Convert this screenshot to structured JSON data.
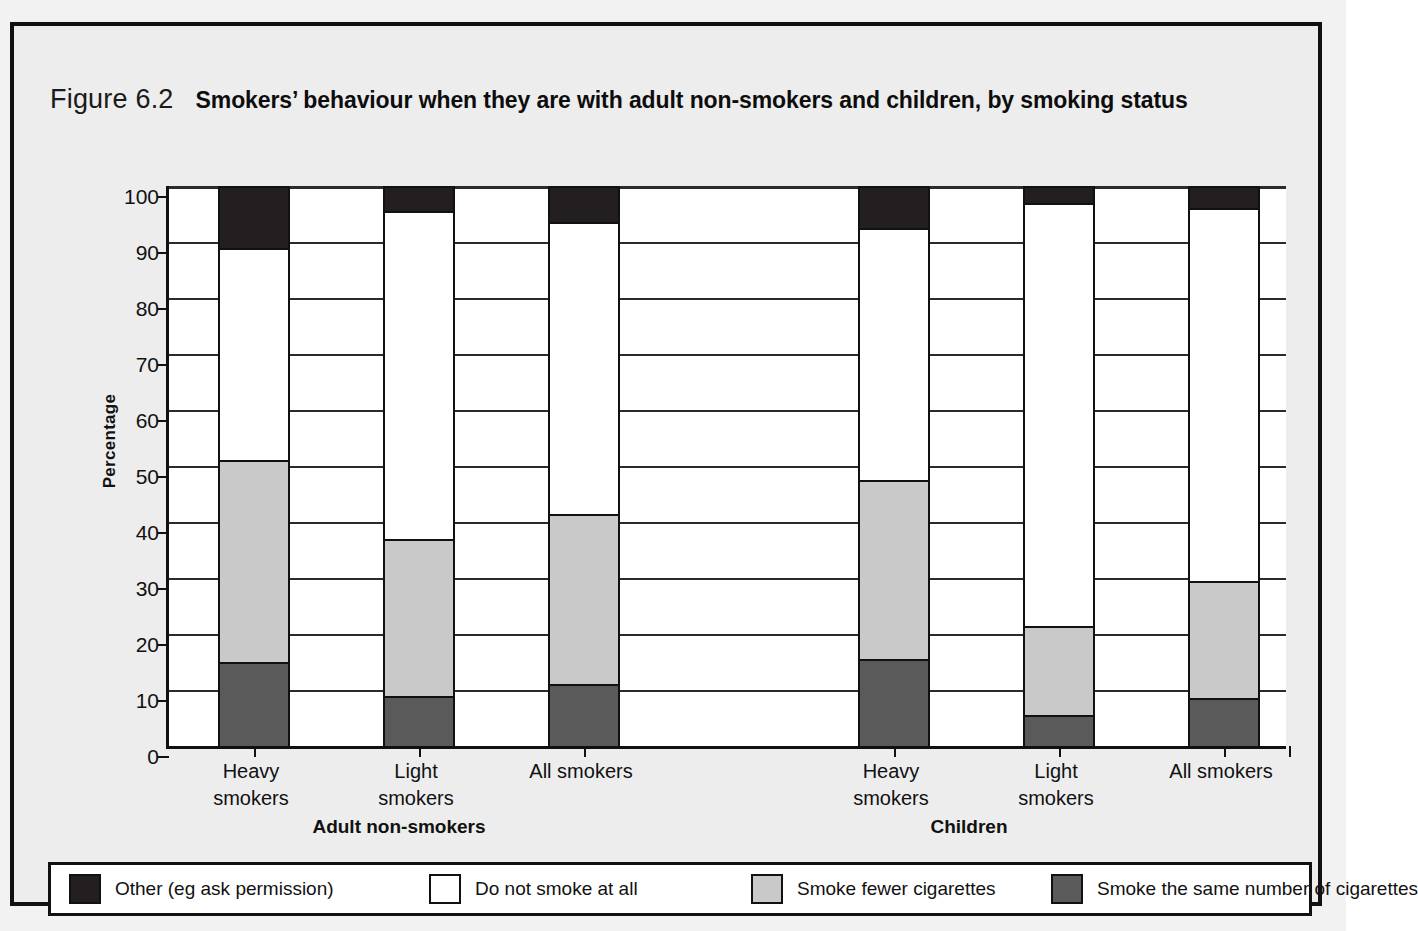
{
  "figure": {
    "number": "Figure 6.2",
    "title": "Smokers’ behaviour when they are with adult non-smokers and children, by smoking status"
  },
  "chart_data": {
    "type": "bar",
    "subtype": "stacked-100-percent",
    "title": "Smokers’ behaviour when they are with adult non-smokers and children, by smoking status",
    "xlabel": "",
    "ylabel": "Percentage",
    "ylim": [
      0,
      100
    ],
    "yticks": [
      0,
      10,
      20,
      30,
      40,
      50,
      60,
      70,
      80,
      90,
      100
    ],
    "grid": true,
    "legend_position": "bottom",
    "groups": [
      "Adult non-smokers",
      "Children"
    ],
    "categories": [
      "Heavy smokers",
      "Light smokers",
      "All smokers",
      "Heavy smokers",
      "Light smokers",
      "All smokers"
    ],
    "category_groups": [
      "Adult non-smokers",
      "Adult non-smokers",
      "Adult non-smokers",
      "Children",
      "Children",
      "Children"
    ],
    "series": [
      {
        "name": "Smoke the same number of cigarettes",
        "color": "#5a5a5a",
        "values": [
          15,
          9,
          11,
          15.5,
          5.5,
          8.5
        ]
      },
      {
        "name": "Smoke fewer cigarettes",
        "color": "#c9c9c9",
        "values": [
          36,
          28,
          30.5,
          32,
          16,
          21
        ]
      },
      {
        "name": "Do not smoke at all",
        "color": "#ffffff",
        "values": [
          38,
          58.5,
          52,
          45,
          75.5,
          66.5
        ]
      },
      {
        "name": "Other (eg ask permission)",
        "color": "#231f20",
        "values": [
          11,
          4.5,
          6.5,
          7.5,
          3,
          4
        ]
      }
    ],
    "cumulative_tops": {
      "note": "stack order bottom→top: same, fewer, do-not-smoke, other",
      "same": [
        15,
        9,
        11,
        15.5,
        5.5,
        8.5
      ],
      "fewer": [
        51,
        37,
        41.5,
        47.5,
        21.5,
        29.5
      ],
      "none": [
        89,
        95.5,
        93.5,
        92.5,
        97,
        96
      ],
      "other": [
        100,
        100,
        100,
        100,
        100,
        100
      ]
    }
  },
  "axis": {
    "y_title": "Percentage",
    "ticks": [
      "100",
      "90",
      "80",
      "70",
      "60",
      "50",
      "40",
      "30",
      "20",
      "10",
      "0"
    ]
  },
  "category_labels": [
    {
      "line1": "Heavy",
      "line2": "smokers"
    },
    {
      "line1": "Light",
      "line2": "smokers"
    },
    {
      "line1": "All smokers",
      "line2": ""
    },
    {
      "line1": "Heavy",
      "line2": "smokers"
    },
    {
      "line1": "Light",
      "line2": "smokers"
    },
    {
      "line1": "All smokers",
      "line2": ""
    }
  ],
  "group_labels": [
    {
      "text": "Adult non-smokers"
    },
    {
      "text": "Children"
    }
  ],
  "legend": {
    "items": [
      {
        "label": "Other (eg ask permission)",
        "color": "#231f20"
      },
      {
        "label": "Do not smoke at all",
        "color": "#ffffff"
      },
      {
        "label": "Smoke fewer cigarettes",
        "color": "#c9c9c9"
      },
      {
        "label": "Smoke the same number of cigarettes",
        "color": "#5a5a5a"
      }
    ]
  },
  "colors": {
    "ink": "#111111",
    "page": "#ededed",
    "plot_bg": "#ffffff"
  }
}
